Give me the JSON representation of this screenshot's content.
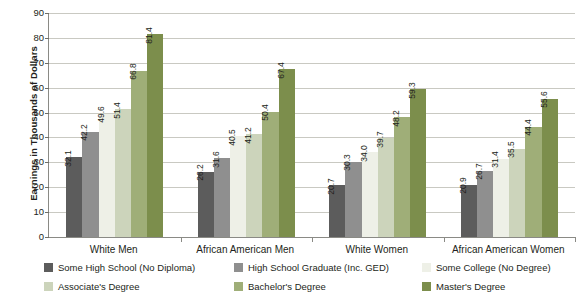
{
  "chart_data": {
    "type": "bar",
    "title": "",
    "subtitle": "",
    "xlabel": "",
    "ylabel": "Earnings in Thousands of Dollars",
    "ylim": [
      0,
      90
    ],
    "ytick_step": 10,
    "yticks": [
      "90",
      "80",
      "70",
      "60",
      "50",
      "40",
      "30",
      "20",
      "10",
      "0"
    ],
    "grid": true,
    "legend_position": "bottom",
    "categories": [
      "White Men",
      "African American Men",
      "White Women",
      "African American Women"
    ],
    "series": [
      {
        "name": "Some High School (No Diploma)",
        "color": "#5c5c5c",
        "values": [
          32.1,
          26.2,
          20.7,
          20.9
        ],
        "labels": [
          "32.1",
          "26.2",
          "20.7",
          "20.9"
        ]
      },
      {
        "name": "High School Graduate (Inc. GED)",
        "color": "#8f8f8f",
        "values": [
          42.2,
          31.6,
          30.3,
          26.7
        ],
        "labels": [
          "42.2",
          "31.6",
          "30.3",
          "26.7"
        ]
      },
      {
        "name": "Some College (No Degree)",
        "color": "#eef0e7",
        "values": [
          49.6,
          40.5,
          34.0,
          31.4
        ],
        "labels": [
          "49.6",
          "40.5",
          "34.0",
          "31.4"
        ]
      },
      {
        "name": "Associate's Degree",
        "color": "#ccd4bb",
        "values": [
          51.4,
          41.2,
          39.7,
          35.5
        ],
        "labels": [
          "51.4",
          "41.2",
          "39.7",
          "35.5"
        ]
      },
      {
        "name": "Bachelor's Degree",
        "color": "#9fae78",
        "values": [
          66.8,
          50.4,
          48.2,
          44.4
        ],
        "labels": [
          "66.8",
          "50.4",
          "48.2",
          "44.4"
        ]
      },
      {
        "name": "Master's Degree",
        "color": "#7c8e4c",
        "values": [
          81.4,
          67.4,
          59.3,
          55.6
        ],
        "labels": [
          "81.4",
          "67.4",
          "59.3",
          "55.6"
        ]
      }
    ]
  },
  "colors": {
    "background": "#ffffff",
    "axis": "#8a8a85",
    "gridline": "#c9c9c2",
    "text": "#231f20"
  }
}
